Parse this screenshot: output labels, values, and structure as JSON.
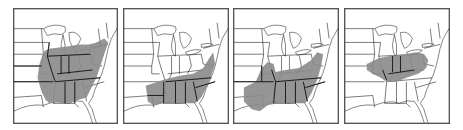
{
  "figure": {
    "colors": {
      "range_fill": "#8a8a8a",
      "state_border": "#222222",
      "frame": "#555555",
      "background": "#ffffff"
    },
    "panels": [
      {
        "id": "map-1",
        "region_shaded": "Broad eastern range: Midwest, Ohio Valley, Southeast, Mid-Atlantic to New England coast"
      },
      {
        "id": "map-2",
        "region_shaded": "Southeast range: Gulf states, Tennessee, Carolinas, Virginia, Mid-Atlantic coast"
      },
      {
        "id": "map-3",
        "region_shaded": "South-central and Southeast range including Texas/Oklahoma, Arkansas, Gulf states, Carolinas, Mid-Atlantic"
      },
      {
        "id": "map-4",
        "region_shaded": "Central band: Illinois, Indiana, Ohio, Kentucky, parts of Missouri and West Virginia"
      }
    ]
  }
}
